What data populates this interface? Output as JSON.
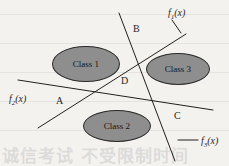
{
  "figure": {
    "background_color": "#f4f2ee",
    "ink_color": "#241f1f",
    "ellipse_fill": "#8e8e8e",
    "ellipse_stroke": "#2a2a2a",
    "width": 229,
    "height": 166
  },
  "classes": [
    {
      "id": "class-1",
      "label": "Class 1",
      "cx": 86,
      "cy": 64,
      "rx": 34,
      "ry": 18
    },
    {
      "id": "class-2",
      "label": "Class 2",
      "cx": 117,
      "cy": 126,
      "rx": 34,
      "ry": 16
    },
    {
      "id": "class-3",
      "label": "Class 3",
      "cx": 178,
      "cy": 69,
      "rx": 32,
      "ry": 16
    }
  ],
  "discriminants": [
    {
      "id": "f1",
      "label": "f",
      "subscript": "1",
      "suffix": "(x)",
      "label_x": 168,
      "label_y": 8,
      "x1": 38,
      "y1": 128,
      "x2": 186,
      "y2": 34
    },
    {
      "id": "f2",
      "label": "f",
      "subscript": "2",
      "suffix": "(x)",
      "label_x": 9,
      "label_y": 94,
      "x1": 18,
      "y1": 80,
      "x2": 213,
      "y2": 110
    },
    {
      "id": "f3",
      "label": "f",
      "subscript": "3",
      "suffix": "(x)",
      "label_x": 201,
      "label_y": 136,
      "x1": 119,
      "y1": 13,
      "x2": 175,
      "y2": 161
    }
  ],
  "leaders": [
    {
      "id": "leader-f1",
      "x1": 172,
      "y1": 20,
      "x2": 181,
      "y2": 33
    },
    {
      "id": "leader-f3",
      "x1": 178,
      "y1": 140,
      "x2": 198,
      "y2": 140
    }
  ],
  "regions": [
    {
      "id": "region-a",
      "label": "A",
      "x": 56,
      "y": 96
    },
    {
      "id": "region-b",
      "label": "B",
      "x": 133,
      "y": 24
    },
    {
      "id": "region-c",
      "label": "C",
      "x": 174,
      "y": 111
    },
    {
      "id": "region-d",
      "label": "D",
      "x": 121,
      "y": 76
    }
  ],
  "scan_artifacts": {
    "bleed_text": "诚信考试 不受限制时间"
  }
}
